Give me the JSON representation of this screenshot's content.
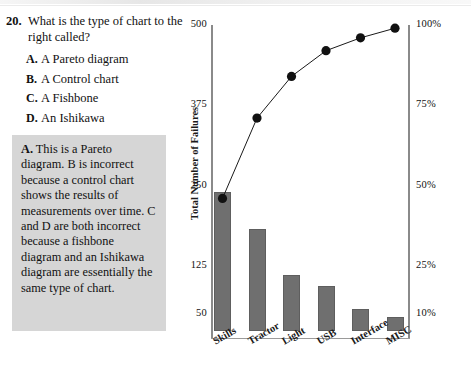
{
  "question": {
    "number": "20.",
    "prompt": "What is the type of chart to the right called?",
    "choices": [
      {
        "letter": "A.",
        "label": "A Pareto diagram"
      },
      {
        "letter": "B.",
        "label": "A Control chart"
      },
      {
        "letter": "C.",
        "label": "A Fishbone"
      },
      {
        "letter": "D.",
        "label": "An Ishikawa"
      }
    ]
  },
  "answer": {
    "lead": "A.",
    "text": "This is a Pareto diagram. B is incorrect because a control chart shows the results of measurements over time. C and D are both incorrect because a fishbone diagram and an Ishikawa diagram are essentially the same type of chart.",
    "background_color": "#d6d6d6"
  },
  "chart_data": {
    "type": "bar",
    "title": "",
    "categories": [
      "Skills",
      "Tractor",
      "Light",
      "USB",
      "Interface",
      "MISC"
    ],
    "values": [
      240,
      182,
      110,
      94,
      58,
      46
    ],
    "xlabel": "",
    "ylabel": "Total Number of Failures",
    "ylim": [
      50,
      500
    ],
    "ytick_labels": [
      "500",
      "375",
      "250",
      "125",
      "50"
    ],
    "ytick_values": [
      500,
      375,
      250,
      125,
      50
    ],
    "y2label": "",
    "y2lim": [
      10,
      100
    ],
    "y2tick_labels": [
      "100%",
      "75%",
      "50%",
      "25%",
      "10%"
    ],
    "y2tick_values": [
      100,
      75,
      50,
      25,
      10
    ],
    "series": [
      {
        "name": "Total Number of Failures",
        "type": "bar",
        "values": [
          240,
          182,
          110,
          94,
          58,
          46
        ]
      },
      {
        "name": "Cumulative Percentage",
        "type": "line",
        "values": [
          46,
          71,
          84,
          92,
          96,
          99
        ]
      }
    ],
    "bar_color": "#6f6f6f",
    "line_color": "#1a1a1a",
    "marker_color": "#111111",
    "grid": false,
    "legend": "none"
  }
}
